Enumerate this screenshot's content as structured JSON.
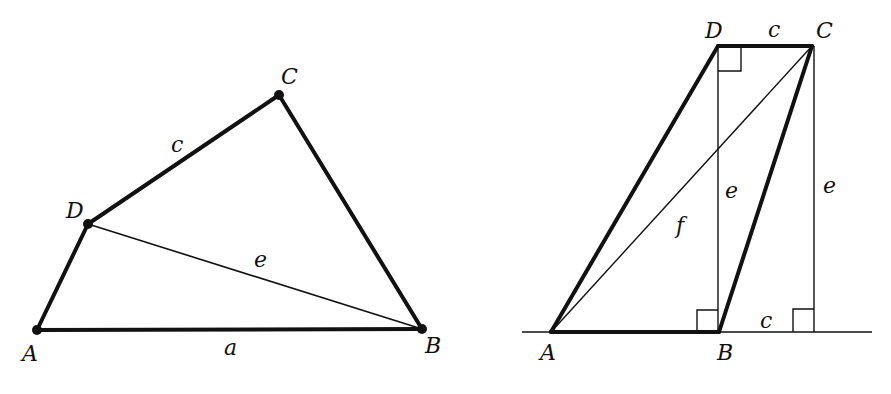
{
  "figures": {
    "left": {
      "description": "Quadrilateral ABCD with diagonal DB",
      "vertices": {
        "A": {
          "label": "A",
          "x": 37,
          "y": 330
        },
        "B": {
          "label": "B",
          "x": 422,
          "y": 329
        },
        "C": {
          "label": "C",
          "x": 279,
          "y": 95
        },
        "D": {
          "label": "D",
          "x": 88,
          "y": 224
        }
      },
      "side_labels": {
        "a": "a",
        "c": "c",
        "e": "e"
      }
    },
    "right": {
      "description": "Trapezoid ABCD with diagonal AC, heights e, and right-angle markers",
      "vertices": {
        "A": {
          "label": "A"
        },
        "B": {
          "label": "B"
        },
        "C": {
          "label": "C"
        },
        "D": {
          "label": "D"
        }
      },
      "side_labels": {
        "c_top": "c",
        "c_bottom": "c",
        "e_inner": "e",
        "e_outer": "e",
        "f": "f"
      }
    }
  },
  "colors": {
    "ink": "#111111",
    "background": "#ffffff"
  }
}
